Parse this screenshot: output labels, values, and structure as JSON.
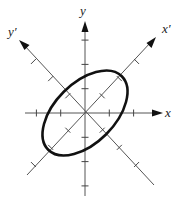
{
  "diagram": {
    "type": "rotated-coordinate-axes-with-ellipse",
    "labels": {
      "x": "x",
      "y": "y",
      "x_prime": "x′",
      "y_prime": "y′"
    },
    "rotation_degrees": 45,
    "ticks_per_half_axis": {
      "x": 2,
      "y": 3,
      "x_prime": 3,
      "y_prime": 3
    },
    "ellipse": {
      "semi_major_axis_units": 2.15,
      "semi_minor_axis_units": 1.25,
      "major_axis_along": "x′"
    },
    "colors": {
      "axes": "#555555",
      "ellipse": "#111111",
      "text": "#222222"
    }
  }
}
